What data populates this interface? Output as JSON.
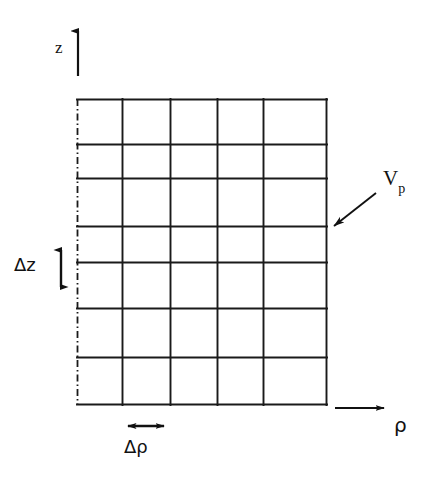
{
  "figure": {
    "background_color": "#ffffff",
    "line_color": "#1a1a1a",
    "width": 432,
    "height": 481
  },
  "axes": {
    "vertical": {
      "label": "z",
      "icon": "up-arrow-icon",
      "shaft_x": 78,
      "tip_y": 28,
      "tail_y": 76
    },
    "horizontal": {
      "label": "ρ",
      "icon": "right-arrow-icon",
      "shaft_y": 408,
      "tail_x": 335,
      "tip_x": 389
    }
  },
  "grid": {
    "name": "finite-volume-mesh",
    "left": 77,
    "right": 327,
    "top": 99,
    "bottom": 405,
    "column_lines": [
      77,
      122,
      170,
      217,
      263,
      327
    ],
    "row_lines": [
      99,
      144,
      178,
      226,
      262,
      308,
      357,
      405
    ],
    "columns": 5,
    "rows": 7,
    "symmetry_axis_style": "dash-dot",
    "symmetry_axis_x": 77
  },
  "annotations": {
    "delta_z": {
      "label": "Δz",
      "icon": "double-arrow-vertical-icon",
      "x": 61,
      "y_top": 245,
      "y_bottom": 292
    },
    "delta_rho": {
      "label": "Δρ",
      "icon": "double-arrow-horizontal-icon",
      "y": 426,
      "x_left": 122,
      "x_right": 170
    },
    "control_volume": {
      "label_main": "V",
      "label_sub": "p",
      "icon": "pointer-arrow-icon",
      "arrow_tail_x": 376,
      "arrow_tail_y": 193,
      "arrow_tip_x": 330,
      "arrow_tip_y": 229
    }
  }
}
